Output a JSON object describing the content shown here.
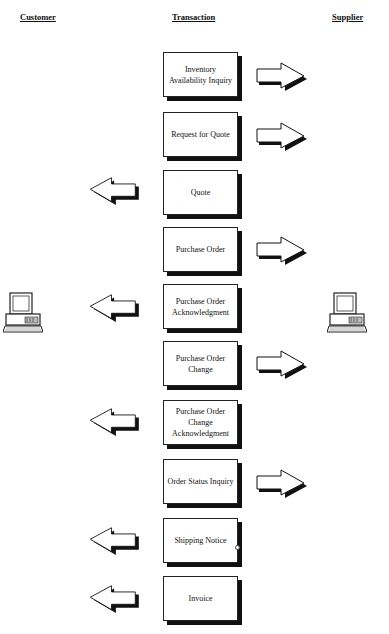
{
  "headers": {
    "customer": "Customer",
    "transaction": "Transaction",
    "supplier": "Supplier"
  },
  "transactions": [
    {
      "label": "Inventory Availability Inquiry",
      "lines": [
        "Inventory",
        "Availability Inquiry"
      ],
      "direction": "to-supplier"
    },
    {
      "label": "Request for Quote",
      "lines": [
        "Request for Quote"
      ],
      "direction": "to-supplier"
    },
    {
      "label": "Quote",
      "lines": [
        "Quote"
      ],
      "direction": "to-customer"
    },
    {
      "label": "Purchase Order",
      "lines": [
        "Purchase Order"
      ],
      "direction": "to-supplier"
    },
    {
      "label": "Purchase Order Acknowledgment",
      "lines": [
        "Purchase Order",
        "Acknowledgment"
      ],
      "direction": "to-customer"
    },
    {
      "label": "Purchase Order Change",
      "lines": [
        "Purchase Order",
        "Change"
      ],
      "direction": "to-supplier"
    },
    {
      "label": "Purchase Order Change Acknowledgment",
      "lines": [
        "Purchase Order",
        "Change",
        "Acknowledgment"
      ],
      "direction": "to-customer"
    },
    {
      "label": "Order Status Inquiry",
      "lines": [
        "Order Status Inquiry"
      ],
      "direction": "to-supplier"
    },
    {
      "label": "Shipping Notice",
      "lines": [
        "Shipping Notice"
      ],
      "direction": "to-customer"
    },
    {
      "label": "Invoice",
      "lines": [
        "Invoice"
      ],
      "direction": "to-customer"
    }
  ],
  "icons": {
    "customer": "desktop-computer-icon",
    "supplier": "desktop-computer-icon",
    "arrow_right": "block-arrow-right-icon",
    "arrow_left": "block-arrow-left-icon"
  }
}
